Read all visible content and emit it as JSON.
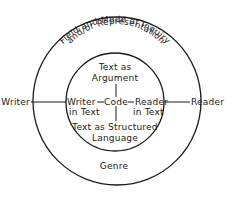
{
  "diagram": {
    "outer_circle": {
      "arc_label_line1": "Field and Mode of Inquiry",
      "arc_label_line2": "and/or Representation",
      "bottom_label": "Genre"
    },
    "inner_circle": {
      "top_label_line1": "Text as",
      "top_label_line2": "Argument",
      "bottom_label_line1": "Text as Structured",
      "bottom_label_line2": "Language",
      "left_label_line1": "Writer",
      "left_label_line2": "in Text",
      "center_label": "Code",
      "right_label_line1": "Reader",
      "right_label_line2": "in Text"
    },
    "outside": {
      "left_label": "Writer",
      "right_label": "Reader"
    },
    "colors": {
      "ink": "#1a1a1a",
      "background": "#ffffff"
    }
  }
}
